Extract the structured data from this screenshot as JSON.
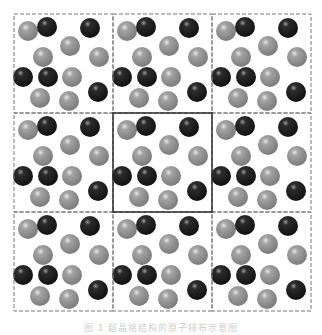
{
  "diagram": {
    "type": "periodic-lattice-tiling",
    "grid": {
      "rows": 3,
      "cols": 3,
      "origin": [
        14,
        14
      ],
      "cell_w": 99,
      "cell_h": 99,
      "highlight_cell": [
        1,
        1
      ]
    },
    "colors": {
      "gray_atom": "#8c8c8c",
      "black_atom": "#1e1e1e",
      "dashed_line": "#777777",
      "solid_line": "#222222"
    },
    "atom_radius": 10,
    "unit_cell_atoms": [
      {
        "x": 14,
        "y": 17,
        "kind": "gray"
      },
      {
        "x": 33,
        "y": 13,
        "kind": "black"
      },
      {
        "x": 76,
        "y": 14,
        "kind": "black"
      },
      {
        "x": 56,
        "y": 32,
        "kind": "gray"
      },
      {
        "x": 29,
        "y": 43,
        "kind": "gray"
      },
      {
        "x": 85,
        "y": 43,
        "kind": "gray"
      },
      {
        "x": 9,
        "y": 63,
        "kind": "black"
      },
      {
        "x": 34,
        "y": 63,
        "kind": "black"
      },
      {
        "x": 58,
        "y": 63,
        "kind": "gray"
      },
      {
        "x": 26,
        "y": 84,
        "kind": "gray"
      },
      {
        "x": 55,
        "y": 87,
        "kind": "gray"
      },
      {
        "x": 84,
        "y": 78,
        "kind": "black"
      }
    ]
  },
  "caption": "图 1  超晶格结构的原子排布示意图"
}
